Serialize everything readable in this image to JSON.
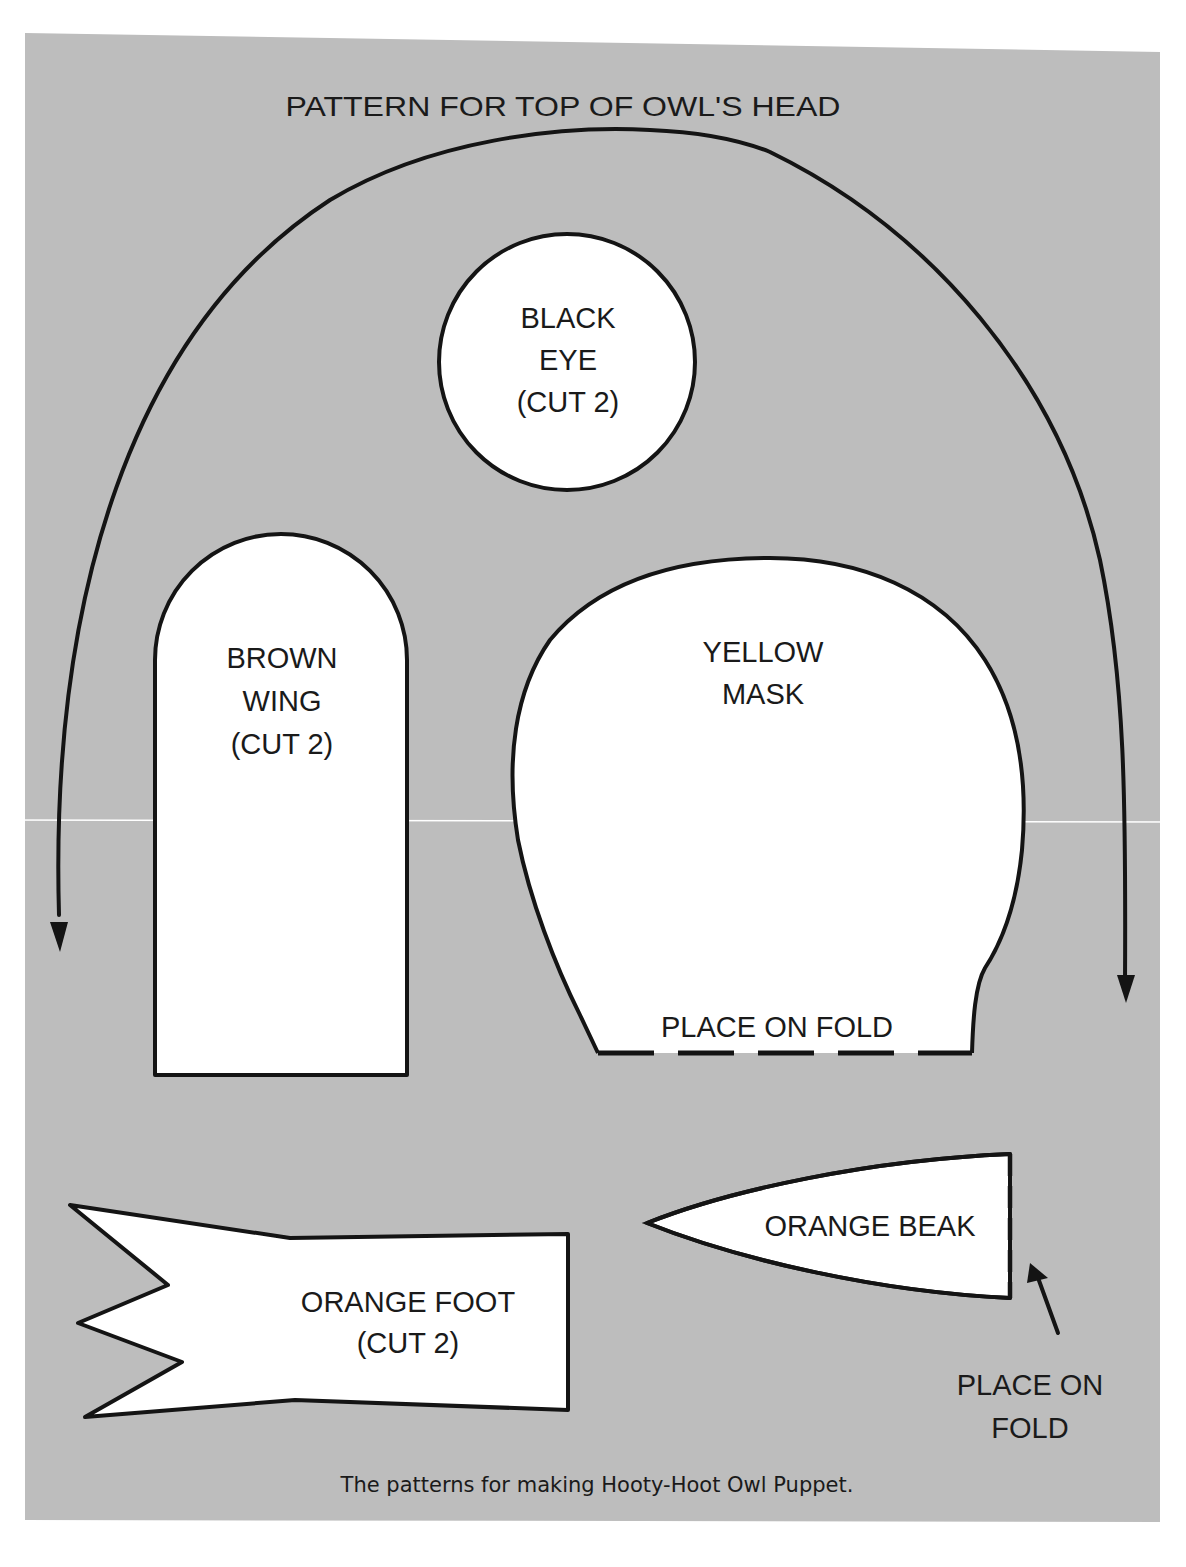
{
  "page": {
    "background_color": "#bdbdbd",
    "paper_color": "#ffffff",
    "ink_color": "#141414"
  },
  "title": "PATTERN FOR TOP OF OWL'S HEAD",
  "pieces": {
    "eye": {
      "line1": "BLACK",
      "line2": "EYE",
      "line3": "(CUT 2)"
    },
    "wing": {
      "line1": "BROWN",
      "line2": "WING",
      "line3": "(CUT 2)"
    },
    "mask": {
      "line1": "YELLOW",
      "line2": "MASK",
      "fold_label": "PLACE ON FOLD"
    },
    "foot": {
      "line1": "ORANGE FOOT",
      "line2": "(CUT 2)"
    },
    "beak": {
      "line1": "ORANGE BEAK",
      "fold_line1": "PLACE ON",
      "fold_line2": "FOLD"
    }
  },
  "caption": "The patterns for making Hooty-Hoot Owl Puppet."
}
